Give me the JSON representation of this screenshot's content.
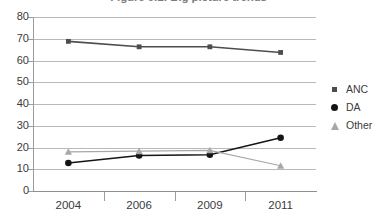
{
  "chart_data": {
    "type": "line",
    "title": "Figure 9.1: Big picture trends",
    "xlabel": "",
    "ylabel": "",
    "categories": [
      "2004",
      "2006",
      "2009",
      "2011"
    ],
    "ylim": [
      0,
      80
    ],
    "y_ticks": [
      "0",
      "10",
      "20",
      "30",
      "40",
      "50",
      "60",
      "70",
      "80"
    ],
    "grid": true,
    "legend_position": "right",
    "series": [
      {
        "name": "ANC",
        "marker": "square",
        "color": "#4d4d4d",
        "values": [
          68.8,
          66.3,
          66.3,
          63.7
        ]
      },
      {
        "name": "DA",
        "marker": "circle",
        "color": "#151515",
        "values": [
          12.9,
          16.3,
          16.7,
          24.5
        ]
      },
      {
        "name": "Other",
        "marker": "triangle",
        "color": "#a8a8a8",
        "values": [
          18.0,
          18.3,
          18.7,
          11.6
        ]
      }
    ]
  },
  "legend": {
    "items": [
      {
        "label": "ANC",
        "marker": "square-marker-icon"
      },
      {
        "label": "DA",
        "marker": "circle-marker-icon"
      },
      {
        "label": "Other",
        "marker": "triangle-marker-icon"
      }
    ]
  },
  "colors": {
    "gridline": "#b9b9b9",
    "axis": "#9d9d9d",
    "background": "#ffffff",
    "text": "#3b3b3b"
  }
}
